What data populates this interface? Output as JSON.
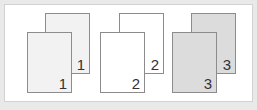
{
  "diagram": {
    "colors": {
      "background": "#e9e9e9",
      "panel": "#ffffff",
      "page_border": "#8c8c8c",
      "set_1_fill": "#f2f2f2",
      "set_2_fill": "#ffffff",
      "set_3_fill": "#dcdcdc"
    },
    "stacks": [
      {
        "back_label": "1",
        "front_label": "1"
      },
      {
        "back_label": "2",
        "front_label": "2"
      },
      {
        "back_label": "3",
        "front_label": "3"
      }
    ]
  }
}
